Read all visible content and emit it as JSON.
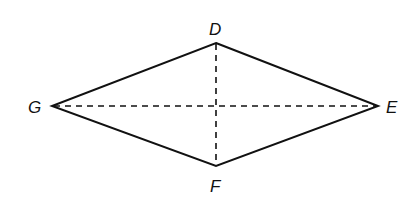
{
  "diagram": {
    "type": "rhombus with diagonals",
    "vertices": {
      "D": {
        "label": "D",
        "x": 216,
        "y": 43
      },
      "E": {
        "label": "E",
        "x": 378,
        "y": 106
      },
      "F": {
        "label": "F",
        "x": 216,
        "y": 166
      },
      "G": {
        "label": "G",
        "x": 52,
        "y": 106
      }
    },
    "sides": [
      "DE",
      "EF",
      "FG",
      "GD"
    ],
    "diagonals_dashed": [
      "DF",
      "GE"
    ],
    "colors": {
      "stroke": "#111111",
      "background": "#ffffff"
    }
  }
}
